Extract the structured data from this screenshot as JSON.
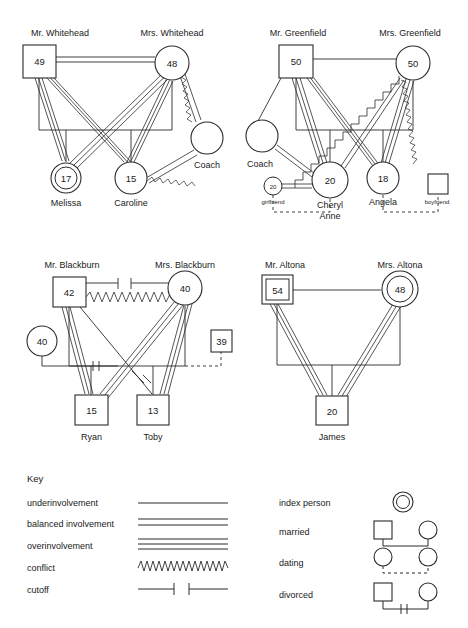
{
  "diagram": {
    "type": "genogram",
    "stroke_color": "#2b2b2b",
    "fill_color": "#ffffff",
    "background": "#ffffff"
  },
  "families": [
    {
      "id": "whitehead",
      "father": {
        "label": "Mr. Whitehead",
        "age": "49",
        "shape": "square",
        "index": false
      },
      "mother": {
        "label": "Mrs. Whitehead",
        "age": "48",
        "shape": "circle",
        "index": false
      },
      "children": [
        {
          "label": "Melissa",
          "age": "17",
          "shape": "circle",
          "index": true
        },
        {
          "label": "Caroline",
          "age": "15",
          "shape": "circle",
          "index": false
        }
      ],
      "others": [
        {
          "label": "Coach",
          "age": "",
          "shape": "circle",
          "index": false
        }
      ],
      "relationships": [
        {
          "from": "father",
          "to": "mother",
          "kind": "balanced involvement"
        },
        {
          "from": "father",
          "to": "Melissa",
          "kind": "overinvolvement"
        },
        {
          "from": "father",
          "to": "Caroline",
          "kind": "overinvolvement"
        },
        {
          "from": "mother",
          "to": "Melissa",
          "kind": "overinvolvement"
        },
        {
          "from": "mother",
          "to": "Caroline",
          "kind": "overinvolvement"
        },
        {
          "from": "mother",
          "to": "Coach",
          "kind": "conflict"
        },
        {
          "from": "Caroline",
          "to": "Coach",
          "kind": "conflict"
        }
      ]
    },
    {
      "id": "greenfield",
      "father": {
        "label": "Mr. Greenfield",
        "age": "50",
        "shape": "square",
        "index": false
      },
      "mother": {
        "label": "Mrs. Greenfield",
        "age": "50",
        "shape": "circle",
        "index": false
      },
      "children": [
        {
          "label": "Cheryl Anne",
          "age": "20",
          "shape": "circle",
          "index": false
        },
        {
          "label": "Angela",
          "age": "18",
          "shape": "circle",
          "index": false
        }
      ],
      "others": [
        {
          "label": "Coach",
          "age": "",
          "shape": "circle",
          "index": false
        },
        {
          "label": "girlfriend",
          "age": "20",
          "shape": "circle",
          "index": false
        },
        {
          "label": "boyfriend",
          "age": "",
          "shape": "square",
          "index": false
        }
      ],
      "relationships": [
        {
          "from": "father",
          "to": "mother",
          "kind": "underinvolvement"
        },
        {
          "from": "father",
          "to": "Coach",
          "kind": "underinvolvement"
        },
        {
          "from": "father",
          "to": "Cheryl Anne",
          "kind": "overinvolvement"
        },
        {
          "from": "father",
          "to": "Angela",
          "kind": "overinvolvement"
        },
        {
          "from": "mother",
          "to": "Cheryl Anne",
          "kind": "conflict"
        },
        {
          "from": "mother",
          "to": "Angela",
          "kind": "overinvolvement"
        },
        {
          "from": "Coach",
          "to": "Cheryl Anne",
          "kind": "balanced involvement"
        },
        {
          "from": "Cheryl Anne",
          "to": "girlfriend",
          "kind": "balanced involvement"
        },
        {
          "from": "Cheryl Anne",
          "to": "girlfriend",
          "kind": "dating"
        },
        {
          "from": "Angela",
          "to": "boyfriend",
          "kind": "dating"
        }
      ]
    },
    {
      "id": "blackburn",
      "father": {
        "label": "Mr. Blackburn",
        "age": "42",
        "shape": "square",
        "index": false
      },
      "mother": {
        "label": "Mrs. Blackburn",
        "age": "40",
        "shape": "circle",
        "index": false
      },
      "children": [
        {
          "label": "Ryan",
          "age": "15",
          "shape": "square",
          "index": false
        },
        {
          "label": "Toby",
          "age": "13",
          "shape": "square",
          "index": false
        }
      ],
      "others": [
        {
          "label": "",
          "age": "40",
          "shape": "circle",
          "index": false
        },
        {
          "label": "",
          "age": "39",
          "shape": "square",
          "index": false
        }
      ],
      "relationships": [
        {
          "from": "father",
          "to": "mother",
          "kind": "cutoff"
        },
        {
          "from": "father",
          "to": "mother",
          "kind": "conflict"
        },
        {
          "from": "father",
          "to": "Ryan",
          "kind": "overinvolvement"
        },
        {
          "from": "father",
          "to": "Toby",
          "kind": "underinvolvement"
        },
        {
          "from": "mother",
          "to": "Ryan",
          "kind": "overinvolvement"
        },
        {
          "from": "mother",
          "to": "Toby",
          "kind": "overinvolvement"
        },
        {
          "from": "40",
          "to": "father",
          "kind": "divorced"
        },
        {
          "from": "39",
          "to": "mother",
          "kind": "dating"
        }
      ]
    },
    {
      "id": "altona",
      "father": {
        "label": "Mr. Altona",
        "age": "54",
        "shape": "square",
        "index": true
      },
      "mother": {
        "label": "Mrs. Altona",
        "age": "48",
        "shape": "circle",
        "index": true
      },
      "children": [
        {
          "label": "James",
          "age": "20",
          "shape": "square",
          "index": false
        }
      ],
      "others": [],
      "relationships": [
        {
          "from": "father",
          "to": "mother",
          "kind": "underinvolvement"
        },
        {
          "from": "father",
          "to": "James",
          "kind": "overinvolvement"
        },
        {
          "from": "mother",
          "to": "James",
          "kind": "overinvolvement"
        }
      ]
    }
  ],
  "key": {
    "title": "Key",
    "line_items": [
      {
        "label": "underinvolvement",
        "glyph": "single-line"
      },
      {
        "label": "balanced involvement",
        "glyph": "double-line"
      },
      {
        "label": "overinvolvement",
        "glyph": "triple-line"
      },
      {
        "label": "conflict",
        "glyph": "zigzag-line"
      },
      {
        "label": "cutoff",
        "glyph": "cutoff-line"
      }
    ],
    "symbol_items": [
      {
        "label": "index person",
        "glyph": "double-circle"
      },
      {
        "label": "married",
        "glyph": "square-line-circle"
      },
      {
        "label": "dating",
        "glyph": "circle-dashed-circle"
      },
      {
        "label": "divorced",
        "glyph": "square-slashed-circle"
      }
    ]
  }
}
